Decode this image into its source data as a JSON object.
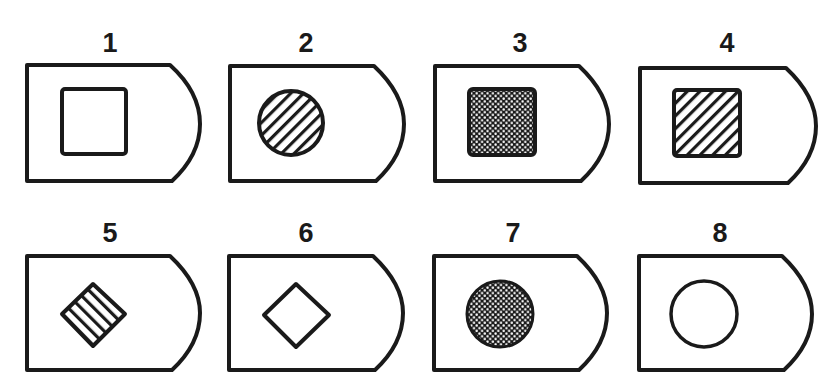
{
  "figure": {
    "colors": {
      "ink": "#1a1a1a",
      "paper": "#ffffff"
    },
    "cards": [
      {
        "label": "1",
        "symbol": "square",
        "fill": "none"
      },
      {
        "label": "2",
        "symbol": "circle",
        "fill": "hatched"
      },
      {
        "label": "3",
        "symbol": "square",
        "fill": "dotted"
      },
      {
        "label": "4",
        "symbol": "square",
        "fill": "hatched"
      },
      {
        "label": "5",
        "symbol": "diamond",
        "fill": "hatched"
      },
      {
        "label": "6",
        "symbol": "diamond",
        "fill": "none"
      },
      {
        "label": "7",
        "symbol": "circle",
        "fill": "dotted"
      },
      {
        "label": "8",
        "symbol": "circle",
        "fill": "none"
      }
    ]
  }
}
